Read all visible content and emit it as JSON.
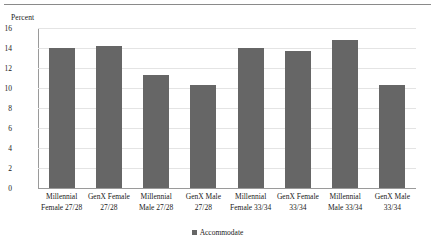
{
  "chart_data": {
    "type": "bar",
    "title": "",
    "xlabel": "",
    "ylabel": "Percent",
    "ylim": [
      0,
      16
    ],
    "ytick_step": 2,
    "yticks": [
      "0",
      "2",
      "4",
      "6",
      "8",
      "10",
      "12",
      "14",
      "16"
    ],
    "grid": true,
    "legend_position": "bottom",
    "legend": [
      "Accommodate"
    ],
    "bar_color": "#666666",
    "categories": [
      "Millennial Female 27/28",
      "GenX Female 27/28",
      "Millennial Male 27/28",
      "GenX Male 27/28",
      "Millennial Female 33/34",
      "GenX Female 33/34",
      "Millennial Male 33/34",
      "GenX Male 33/34"
    ],
    "category_lines": [
      [
        "Millennial",
        "Female 27/28"
      ],
      [
        "GenX Female",
        "27/28"
      ],
      [
        "Millennial",
        "Male 27/28"
      ],
      [
        "GenX Male",
        "27/28"
      ],
      [
        "Millennial",
        "Female 33/34"
      ],
      [
        "GenX Female",
        "33/34"
      ],
      [
        "Millennial",
        "Male 33/34"
      ],
      [
        "GenX Male",
        "33/34"
      ]
    ],
    "series": [
      {
        "name": "Accommodate",
        "values": [
          14.0,
          14.2,
          11.3,
          10.3,
          14.0,
          13.7,
          14.8,
          10.3
        ]
      }
    ]
  }
}
